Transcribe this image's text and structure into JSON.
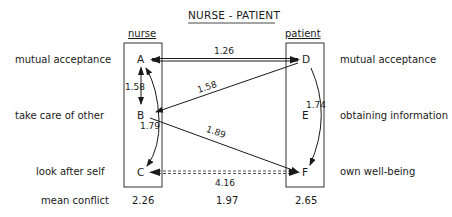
{
  "title": "NURSE - PATIENT",
  "columns": {
    "nurse": "nurse",
    "patient": "patient"
  },
  "left_labels": [
    "mutual acceptance",
    "take care of other",
    "look after self",
    "mean conflict"
  ],
  "right_labels": [
    "mutual acceptance",
    "obtaining information",
    "own well-being"
  ],
  "nodes": {
    "A": "A",
    "B": "B",
    "C": "C",
    "D": "D",
    "E": "E",
    "F": "F"
  },
  "edges": [
    {
      "from": "D",
      "to": "A",
      "weight": "1.26",
      "style": "double"
    },
    {
      "from": "A",
      "to": "B",
      "weight": "1.58",
      "style": "bidirectional"
    },
    {
      "from": "D",
      "to": "B",
      "weight": "1.58",
      "style": "solid"
    },
    {
      "from": "B",
      "to": "A",
      "weight": "1.79",
      "style": "curved",
      "note": "curved arrows B-A and B-C"
    },
    {
      "from": "B",
      "to": "F",
      "weight": "1.89",
      "style": "solid"
    },
    {
      "from": "D",
      "to": "F",
      "weight": "1.74",
      "style": "curved"
    },
    {
      "from": "F",
      "to": "C",
      "weight": "4.16",
      "style": "dashed-bidirectional"
    }
  ],
  "weights": {
    "dA": "1.26",
    "ab": "1.58",
    "db": "1.58",
    "bc": "1.79",
    "bf": "1.89",
    "df": "1.74",
    "fc": "4.16"
  },
  "mean_conflict": {
    "nurse": "2.26",
    "middle": "1.97",
    "patient": "2.65"
  }
}
